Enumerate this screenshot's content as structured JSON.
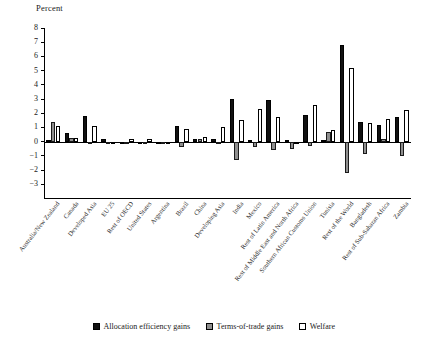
{
  "chart_data": {
    "type": "bar",
    "title": "",
    "subtitle": "",
    "ylabel": "Percent",
    "xlabel": "",
    "ylim": [
      -3,
      8
    ],
    "yticks": [
      8,
      7,
      6,
      5,
      4,
      3,
      2,
      1,
      0,
      -1,
      -2,
      -3
    ],
    "ytick_labels": [
      "8",
      "7",
      "6",
      "5",
      "4",
      "3",
      "2",
      "1",
      "0",
      "−1",
      "−2",
      "−3"
    ],
    "grid": false,
    "legend_position": "bottom",
    "categories": [
      "Australia/New Zealand",
      "Canada",
      "Developed Asia",
      "EU 25",
      "Rest of OECD",
      "United States",
      "Argentina",
      "Brazil",
      "China",
      "Developing Asia",
      "India",
      "Mexico",
      "Rest of Latin America",
      "Rest of Middle East and North Africa",
      "Southern African Customs Union",
      "Tunisia",
      "Rest of the World",
      "Bangladesh",
      "Rest of Sub-Saharan Africa",
      "Zambia"
    ],
    "series": [
      {
        "name": "Allocation efficiency gains",
        "color": "#111111",
        "values": [
          0.1,
          0.6,
          1.8,
          0.2,
          0.0,
          0.0,
          0.0,
          1.1,
          0.2,
          0.2,
          3.0,
          0.1,
          2.9,
          0.1,
          1.9,
          0.1,
          6.8,
          1.4,
          1.2,
          1.7
        ]
      },
      {
        "name": "Terms-of-trade gains",
        "color": "#8f8f8f",
        "values": [
          1.35,
          0.25,
          0.0,
          -0.15,
          0.0,
          0.0,
          0.0,
          -0.35,
          0.15,
          0.0,
          -1.3,
          -0.35,
          -0.6,
          -0.55,
          -0.3,
          0.65,
          -2.2,
          -0.9,
          0.15,
          -1.0
        ]
      },
      {
        "name": "Welfare",
        "color": "#ffffff",
        "values": [
          1.1,
          0.25,
          1.1,
          -0.1,
          0.15,
          0.2,
          -0.2,
          0.9,
          0.3,
          1.0,
          1.5,
          2.3,
          1.7,
          0.0,
          2.6,
          0.8,
          5.2,
          1.3,
          1.6,
          2.2
        ]
      }
    ]
  },
  "legend": {
    "items": [
      {
        "label": "Allocation efficiency gains",
        "swatch": "black"
      },
      {
        "label": "Terms-of-trade gains",
        "swatch": "gray"
      },
      {
        "label": "Welfare",
        "swatch": "white"
      }
    ]
  }
}
